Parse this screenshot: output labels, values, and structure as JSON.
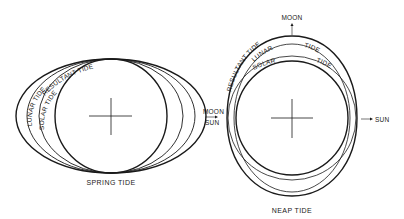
{
  "diagram": {
    "type": "tide-diagram",
    "colors": {
      "line": "#1a1a1a",
      "background": "#ffffff"
    },
    "spring": {
      "caption": "SPRING TIDE",
      "labels": {
        "resultant": "RESULTANT TIDE",
        "lunar": "LUNAR TIDE",
        "solar": "SOLAR TIDE"
      },
      "direction_label_top": "MOON",
      "direction_label_bottom": "SUN"
    },
    "neap": {
      "caption": "NEAP TIDE",
      "labels": {
        "resultant": "RESULTANT TIDE",
        "lunar": "LUNAR",
        "lunar_tide": "TIDE",
        "solar": "SOLAR",
        "solar_tide": "TIDE"
      },
      "moon_label": "MOON",
      "sun_label": "SUN"
    }
  }
}
